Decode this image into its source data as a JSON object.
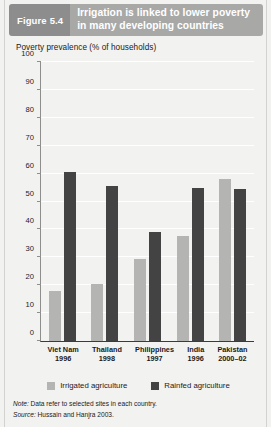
{
  "header": {
    "figure_word": "Figure",
    "figure_number": "5.4",
    "title": "Irrigation is linked to lower poverty in many developing countries",
    "tag_bg": "#8d8d8d",
    "title_bg": "#a8a8a7"
  },
  "axis_title": "Poverty prevalence (% of households)",
  "legend": {
    "items": [
      {
        "label": "Irrigated agriculture",
        "color": "#b4b4b2"
      },
      {
        "label": "Rainfed agriculture",
        "color": "#434343"
      }
    ]
  },
  "notes": {
    "note_lead": "Note:",
    "note_text": " Data refer to selected sites in each country.",
    "source_lead": "Source:",
    "source_text": " Hussain and Hanjra 2003."
  },
  "chart_data": {
    "type": "bar",
    "title": "Irrigation is linked to lower poverty in many developing countries",
    "xlabel": "",
    "ylabel": "Poverty prevalence (% of households)",
    "ylim": [
      0,
      100
    ],
    "yticks": [
      0,
      10,
      20,
      30,
      40,
      50,
      60,
      70,
      80,
      90,
      100
    ],
    "ytick_labels": [
      "0",
      "10",
      "20",
      "30",
      "40",
      "50",
      "60",
      "70",
      "80",
      "90",
      "100"
    ],
    "grid": true,
    "grid_axis": "y",
    "legend_position": "bottom-center",
    "categories": [
      "Viet Nam",
      "Thailand",
      "Philippines",
      "India",
      "Pakistan"
    ],
    "category_years": [
      "1996",
      "1998",
      "1997",
      "1996",
      "2000–02"
    ],
    "series": [
      {
        "name": "Irrigated agriculture",
        "color": "#b4b4b2",
        "values": [
          18,
          20.5,
          29.5,
          37.5,
          58
        ]
      },
      {
        "name": "Rainfed agriculture",
        "color": "#434343",
        "values": [
          60.5,
          55.5,
          39,
          55,
          54.5
        ]
      }
    ]
  }
}
